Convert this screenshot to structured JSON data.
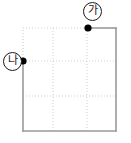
{
  "figure": {
    "type": "geometry-diagram",
    "title": "",
    "background_color": "#ffffff",
    "square": {
      "name": "square-outline",
      "x": 23,
      "y": 28,
      "width": 93,
      "height": 103,
      "stroke_color": "#9a9a9a",
      "stroke_width": 1.6,
      "fill": "none"
    },
    "grid": {
      "name": "dotted-grid",
      "stroke_color": "#cfcfcf",
      "stroke_width": 1,
      "dash": "1,2",
      "vertical_lines_x": [
        53,
        87
      ],
      "horizontal_lines_y": [
        61,
        96
      ],
      "divisions_x": 3,
      "divisions_y": 3
    },
    "points": [
      {
        "name": "point-ga",
        "label": "가",
        "x": 88,
        "y": 28,
        "edge": "top",
        "dot_color": "#000000",
        "dot_radius": 3.6,
        "label_color": "#1a1a1a"
      },
      {
        "name": "point-na",
        "label": "나",
        "x": 23,
        "y": 61,
        "edge": "left",
        "dot_color": "#000000",
        "dot_radius": 3.6,
        "label_color": "#1a1a1a"
      }
    ]
  }
}
